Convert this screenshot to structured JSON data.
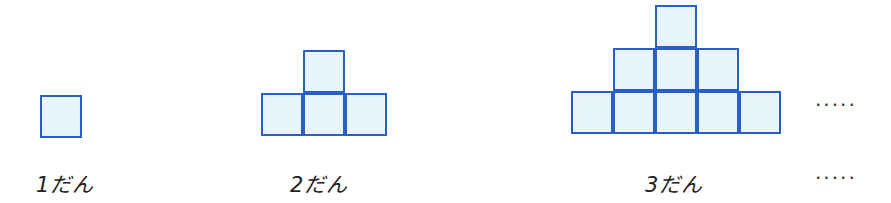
{
  "colors": {
    "border": "#2a5fc6",
    "fill": "#e8f4fb"
  },
  "figures": [
    {
      "label": "1だん",
      "rows": 1
    },
    {
      "label": "2だん",
      "rows": 2
    },
    {
      "label": "3だん",
      "rows": 3
    }
  ],
  "continuation": {
    "figure_dots": "·····",
    "label_dots": "·····"
  }
}
